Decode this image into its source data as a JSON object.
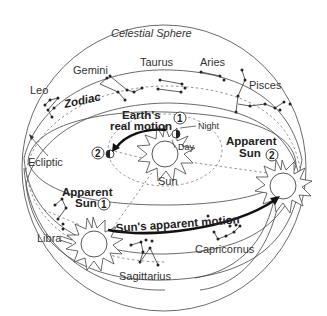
{
  "title": "Celestial Sphere",
  "labels": {
    "zodiac": "Zodiac",
    "ecliptic": "Ecliptic",
    "earths_real_motion_line1": "Earth's",
    "earths_real_motion_line2": "real motion",
    "night": "Night",
    "day": "Day",
    "sun": "Sun",
    "apparent_sun_1_line1": "Apparent",
    "apparent_sun_1_line2": "Sun",
    "apparent_sun_2_line1": "Apparent",
    "apparent_sun_2_line2": "Sun",
    "suns_apparent_motion": "Sun's apparent motion",
    "position_1": "1",
    "position_2": "2"
  },
  "constellations": [
    {
      "name": "Leo"
    },
    {
      "name": "Gemini"
    },
    {
      "name": "Taurus"
    },
    {
      "name": "Aries"
    },
    {
      "name": "Pisces"
    },
    {
      "name": "Libra"
    },
    {
      "name": "Sagittarius"
    },
    {
      "name": "Capricornus"
    }
  ],
  "colors": {
    "line": "#444444",
    "text": "#333333",
    "background": "#ffffff"
  }
}
